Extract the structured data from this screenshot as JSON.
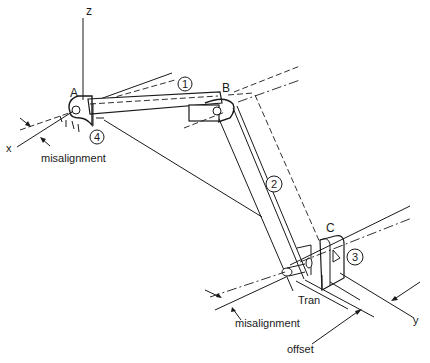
{
  "diagram": {
    "axes": {
      "z": "z",
      "x": "x",
      "y": "y"
    },
    "joints": {
      "a": "A",
      "b": "B",
      "c": "C"
    },
    "links": {
      "link1": "1",
      "link2": "2",
      "link3": "3",
      "link4": "4"
    },
    "annotations": {
      "misalignment_top": "misalignment",
      "misalignment_bottom": "misalignment",
      "tran": "Tran",
      "offset": "offset"
    },
    "colors": {
      "line": "#1a1a1a",
      "background": "#ffffff"
    }
  }
}
